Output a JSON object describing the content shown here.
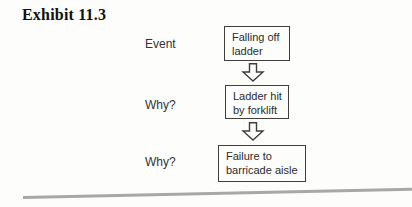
{
  "title": "Exhibit 11.3",
  "flowchart": {
    "steps": [
      {
        "label": "Event",
        "box_text": "Falling off\nladder"
      },
      {
        "label": "Why?",
        "box_text": "Ladder hit\nby forklift"
      },
      {
        "label": "Why?",
        "box_text": "Failure to\nbarricade aisle"
      }
    ],
    "connector_icon": "down-block-arrow"
  },
  "colors": {
    "background": "#fdfdfb",
    "box_border": "#3f3f3f",
    "box_text": "#2b2b2b",
    "label_text": "#333333",
    "title_text": "#111111",
    "bottom_rule": "#a8a8a8"
  }
}
